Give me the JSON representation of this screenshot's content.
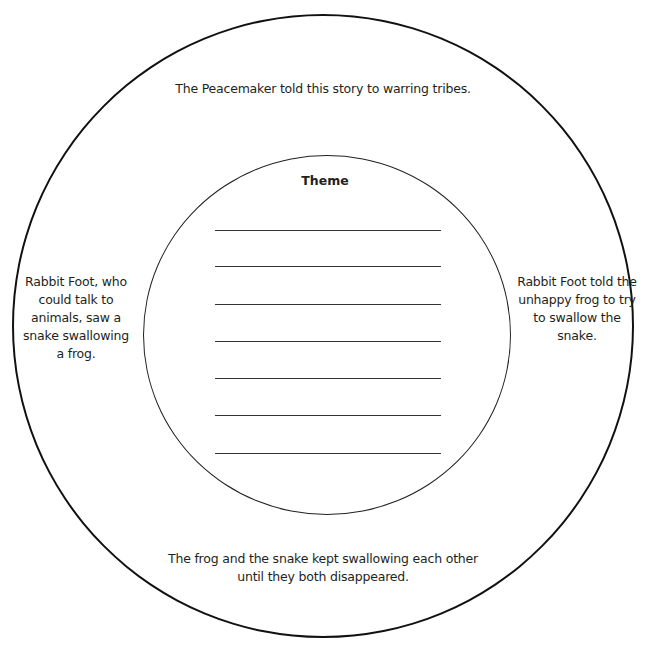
{
  "diagram": {
    "type": "concentric-circle graphic organizer",
    "outer_ring": {
      "top": "The Peacemaker told this story to warring tribes.",
      "left": "Rabbit Foot, who could talk to animals, saw a snake swallowing a frog.",
      "left_lines": [
        "Rabbit Foot, who",
        "could talk to",
        "animals, saw a",
        "snake swallowing",
        "a frog."
      ],
      "right": "Rabbit Foot told the unhappy frog to try to swallow the snake.",
      "right_lines": [
        "Rabbit Foot told the",
        "unhappy frog to try",
        "to swallow the",
        "snake."
      ],
      "bottom": "The frog and the snake kept swallowing each other until they both disappeared.",
      "bottom_lines": [
        "The frog and the snake kept swallowing each other",
        "until they both disappeared."
      ]
    },
    "inner_circle": {
      "title": "Theme",
      "answer_line_count": 7
    }
  }
}
